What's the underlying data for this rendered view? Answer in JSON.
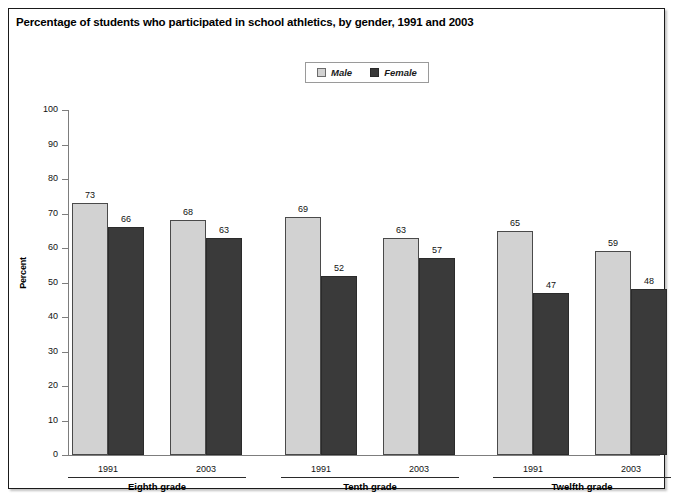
{
  "figure": {
    "title": "Percentage of students who participated in school athletics, by gender, 1991 and 2003"
  },
  "legend": {
    "items": [
      {
        "label": "Male",
        "color": "#d2d2d2",
        "swatch": "legend-swatch-male"
      },
      {
        "label": "Female",
        "color": "#3a3a3a",
        "swatch": "legend-swatch-female"
      }
    ]
  },
  "axis": {
    "y_title": "Percent",
    "y_ticks": [
      "0",
      "10",
      "20",
      "30",
      "40",
      "50",
      "60",
      "70",
      "80",
      "90",
      "100"
    ]
  },
  "groups": [
    {
      "label": "Eighth grade",
      "years": [
        "1991",
        "2003"
      ]
    },
    {
      "label": "Tenth grade",
      "years": [
        "1991",
        "2003"
      ]
    },
    {
      "label": "Twelfth grade",
      "years": [
        "1991",
        "2003"
      ]
    }
  ],
  "bar_labels": [
    "73",
    "66",
    "68",
    "63",
    "69",
    "52",
    "63",
    "57",
    "65",
    "47",
    "59",
    "48"
  ],
  "chart_data": {
    "type": "bar",
    "title": "Percentage of students who participated in school athletics, by gender, 1991 and 2003",
    "xlabel": "",
    "ylabel": "Percent",
    "ylim": [
      0,
      100
    ],
    "ytick_step": 10,
    "grid": false,
    "legend_position": "top-center",
    "categories": [
      "Eighth grade 1991",
      "Eighth grade 2003",
      "Tenth grade 1991",
      "Tenth grade 2003",
      "Twelfth grade 1991",
      "Twelfth grade 2003"
    ],
    "group_labels": [
      "Eighth grade",
      "Tenth grade",
      "Twelfth grade"
    ],
    "years": [
      "1991",
      "2003"
    ],
    "series": [
      {
        "name": "Male",
        "color": "#d2d2d2",
        "values": [
          73,
          68,
          69,
          63,
          65,
          59
        ]
      },
      {
        "name": "Female",
        "color": "#3a3a3a",
        "values": [
          66,
          63,
          52,
          57,
          47,
          48
        ]
      }
    ]
  }
}
